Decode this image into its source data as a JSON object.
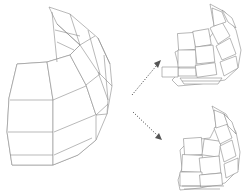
{
  "diagram": {
    "type": "3d-wireframe-transformation",
    "elements": [
      {
        "id": "source",
        "label": "",
        "description": "Intact curved shell wireframe (dome segment)"
      },
      {
        "id": "result-top",
        "label": "",
        "description": "Shell with panels offset/separated"
      },
      {
        "id": "result-bottom",
        "label": "",
        "description": "Shell with panels more fragmented"
      }
    ],
    "arrows": [
      {
        "from": "source",
        "to": "result-top",
        "style": "dotted"
      },
      {
        "from": "source",
        "to": "result-bottom",
        "style": "dotted"
      }
    ],
    "colors": {
      "stroke": "#8a8a8a",
      "arrow": "#555555",
      "background": "#ffffff"
    }
  }
}
